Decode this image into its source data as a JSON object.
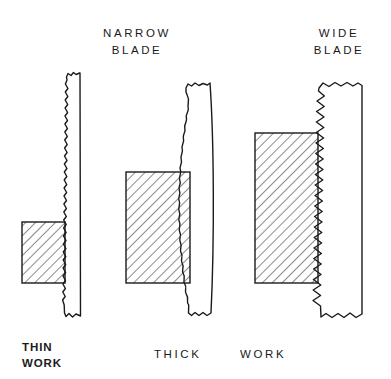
{
  "figure": {
    "background_color": "#ffffff",
    "line_color": "#1a1a1a",
    "hatch_color": "#2b2b2b"
  },
  "labels": {
    "narrow_blade": "NARROW\nBLADE",
    "wide_blade": "WIDE\nBLADE",
    "thin_work": "THIN\nWORK",
    "thick_word": "THICK",
    "work_word": "WORK"
  },
  "assemblies": [
    {
      "name": "narrow-blade-thin-work",
      "blade": {
        "label": "NARROW BLADE",
        "width_px": 17,
        "tooth_size": "fine",
        "tooth_count": 13,
        "deflection": "straight",
        "edges": "torn"
      },
      "work": {
        "label": "THIN WORK",
        "width_px": 43,
        "height_px": 61,
        "hatch_angle_deg": 45
      }
    },
    {
      "name": "narrow-blade-thick-work",
      "blade": {
        "label": "NARROW BLADE",
        "width_px": 25,
        "tooth_size": "medium",
        "tooth_count": 16,
        "deflection": "bowed",
        "edges": "torn"
      },
      "work": {
        "label": "THICK WORK",
        "width_px": 64,
        "height_px": 111,
        "hatch_angle_deg": 45
      }
    },
    {
      "name": "wide-blade-thick-work",
      "blade": {
        "label": "WIDE BLADE",
        "width_px": 44,
        "tooth_size": "coarse",
        "tooth_count": 17,
        "deflection": "straight",
        "edges": "torn"
      },
      "work": {
        "label": "THICK WORK",
        "width_px": 63,
        "height_px": 150,
        "hatch_angle_deg": 45
      }
    }
  ]
}
